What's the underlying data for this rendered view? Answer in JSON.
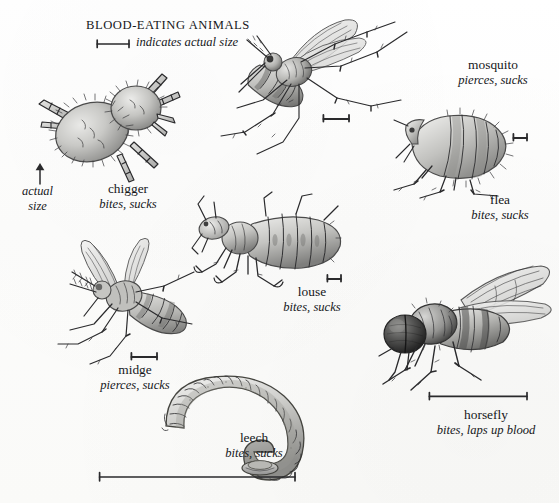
{
  "plate": {
    "title": "BLOOD-EATING ANIMALS",
    "legend_note": "indicates actual size",
    "actual_size_caption_line1": "actual",
    "actual_size_caption_line2": "size",
    "background_color": "#fdfdfc",
    "ink_color": "#2a2a2c",
    "width": 559,
    "height": 503
  },
  "specimens": [
    {
      "id": "chigger",
      "name": "chigger",
      "feeding": "bites, sucks",
      "label_x": 82,
      "label_y": 181,
      "scalebar_length_px": 0,
      "has_scalebar": false
    },
    {
      "id": "mosquito",
      "name": "mosquito",
      "feeding": "pierces, sucks",
      "label_x": 438,
      "label_y": 57,
      "scalebar_length_px": 26,
      "has_scalebar": true
    },
    {
      "id": "flea",
      "name": "flea",
      "feeding": "bites, sucks",
      "label_x": 452,
      "label_y": 192,
      "scalebar_length_px": 14,
      "has_scalebar": true
    },
    {
      "id": "louse",
      "name": "louse",
      "feeding": "bites, sucks",
      "label_x": 266,
      "label_y": 284,
      "scalebar_length_px": 14,
      "has_scalebar": true
    },
    {
      "id": "midge",
      "name": "midge",
      "feeding": "pierces, sucks",
      "label_x": 80,
      "label_y": 362,
      "scalebar_length_px": 26,
      "has_scalebar": true
    },
    {
      "id": "horsefly",
      "name": "horsefly",
      "feeding": "bites, laps up blood",
      "label_x": 416,
      "label_y": 407,
      "scalebar_length_px": 98,
      "has_scalebar": true
    },
    {
      "id": "leech",
      "name": "leech",
      "feeding": "bites, sucks",
      "label_x": 208,
      "label_y": 430,
      "scalebar_length_px": 196,
      "has_scalebar": true
    }
  ]
}
